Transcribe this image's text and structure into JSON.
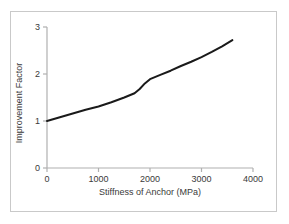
{
  "chart_data": {
    "type": "line",
    "title": "",
    "xlabel": "Stiffness of Anchor (MPa)",
    "ylabel": "Improvement Factor",
    "xlim": [
      0,
      4000
    ],
    "ylim": [
      0,
      3
    ],
    "xticks": [
      0,
      1000,
      2000,
      3000,
      4000
    ],
    "xtick_labels": [
      "0",
      "1000",
      "2000",
      "3000",
      "4000"
    ],
    "yticks": [
      0,
      1,
      2,
      3
    ],
    "ytick_labels": [
      "0",
      "1",
      "2",
      "3"
    ],
    "grid": false,
    "legend": null,
    "series": [
      {
        "name": "Improvement Factor",
        "color": "#1a1a1a",
        "line_width": 2,
        "x": [
          0,
          250,
          500,
          750,
          1000,
          1250,
          1500,
          1700,
          1800,
          1900,
          2000,
          2200,
          2400,
          2600,
          2800,
          3000,
          3200,
          3400,
          3600
        ],
        "y": [
          1.0,
          1.08,
          1.16,
          1.24,
          1.31,
          1.4,
          1.5,
          1.59,
          1.68,
          1.8,
          1.89,
          1.98,
          2.07,
          2.17,
          2.26,
          2.36,
          2.47,
          2.59,
          2.72
        ]
      }
    ]
  },
  "axes": {
    "x_title": "Stiffness of Anchor (MPa)",
    "y_title": "Improvement Factor",
    "x_tick_0": "0",
    "x_tick_1": "1000",
    "x_tick_2": "2000",
    "x_tick_3": "3000",
    "x_tick_4": "4000",
    "y_tick_0": "0",
    "y_tick_1": "1",
    "y_tick_2": "2",
    "y_tick_3": "3"
  },
  "colors": {
    "line": "#1a1a1a",
    "axis": "#b0b0b0",
    "frame": "#c9c9c9",
    "text": "#3a3a3a",
    "background": "#ffffff"
  }
}
